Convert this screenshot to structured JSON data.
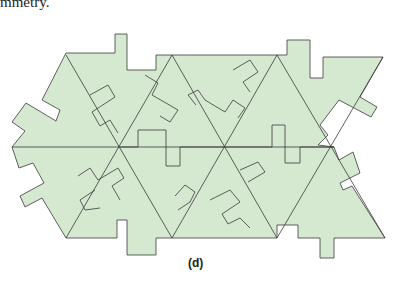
{
  "text_top": "mmetry.",
  "figure_label": "(d)",
  "colors": {
    "fill": "#d5e8d0",
    "stroke": "#3a3a3a"
  },
  "figure": {
    "outline": "66,53 115,53 115,34 127,34 127,70 156,70 156,55 173,55 174,54 277,54 287,54 287,40 310,40 310,78 323,78 323,57 383,57 360,95 377,105 371,117 335,100 320,125 326,130 317,140 303,160 315,165 330,156 340,180 320,190 325,200 335,206 355,238 312,238 312,258 295,258 295,225 277,225 277,238 230,238 172,238 156,238 156,255 127,255 127,220 117,220 117,238 66,238 43,200 25,208 20,196 42,184 30,163 18,168 12,147 26,130 12,120 25,100 53,118 58,105 44,98"
  },
  "inner_lines": [
    "12,147 334,147",
    "66,53 182,243",
    "174,54 66,238",
    "277,54 172,238",
    "277,238 172,57",
    "383,57 277,238"
  ]
}
